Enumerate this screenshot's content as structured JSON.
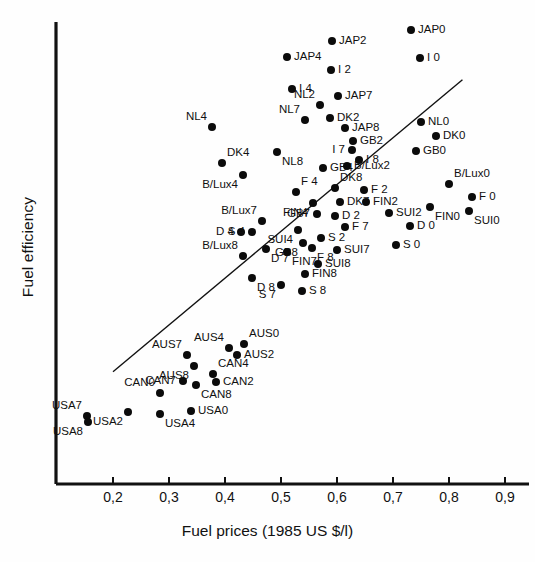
{
  "chart_data": {
    "type": "scatter",
    "title": "",
    "xlabel": "Fuel prices  (1985 US $/l)",
    "ylabel": "Fuel efficiency",
    "xlim": [
      0.15,
      0.93
    ],
    "ylim": [
      0,
      1
    ],
    "grid": false,
    "legend": "none",
    "xticks": [
      "0,2",
      "0,3",
      "0,4",
      "0,5",
      "0,6",
      "0,7",
      "0,8",
      "0,9"
    ],
    "xtick_values": [
      0.2,
      0.3,
      0.4,
      0.5,
      0.6,
      0.7,
      0.8,
      0.9
    ],
    "yticks": [],
    "annotations": [
      "Regression line drawn from lower-left to upper-right"
    ],
    "trend_line": {
      "x1": 0.2,
      "y1": 0.243,
      "x2": 0.824,
      "y2": 0.875
    },
    "points": [
      {
        "label": "JAP2",
        "px": 332,
        "py": 41,
        "side": "r"
      },
      {
        "label": "JAP0",
        "px": 411,
        "py": 30,
        "side": "r"
      },
      {
        "label": "JAP4",
        "px": 287,
        "py": 57,
        "side": "r"
      },
      {
        "label": "I 0",
        "px": 420,
        "py": 58,
        "side": "r"
      },
      {
        "label": "I 2",
        "px": 331,
        "py": 70,
        "side": "r"
      },
      {
        "label": "I 4",
        "px": 292,
        "py": 89,
        "side": "r"
      },
      {
        "label": "JAP7",
        "px": 338,
        "py": 96,
        "side": "r"
      },
      {
        "label": "NL2",
        "px": 320,
        "py": 105,
        "side": "lt"
      },
      {
        "label": "NL7",
        "px": 305,
        "py": 120,
        "side": "lt"
      },
      {
        "label": "DK2",
        "px": 330,
        "py": 118,
        "side": "r"
      },
      {
        "label": "NL4",
        "px": 212,
        "py": 127,
        "side": "lt"
      },
      {
        "label": "JAP8",
        "px": 345,
        "py": 128,
        "side": "r"
      },
      {
        "label": "NL0",
        "px": 421,
        "py": 122,
        "side": "r"
      },
      {
        "label": "DK0",
        "px": 436,
        "py": 136,
        "side": "r"
      },
      {
        "label": "GB2",
        "px": 353,
        "py": 141,
        "side": "r"
      },
      {
        "label": "I 7",
        "px": 352,
        "py": 150,
        "side": "l"
      },
      {
        "label": "GB0",
        "px": 416,
        "py": 151,
        "side": "r"
      },
      {
        "label": "I 8",
        "px": 359,
        "py": 160,
        "side": "r"
      },
      {
        "label": "NL8",
        "px": 277,
        "py": 152,
        "side": "rb"
      },
      {
        "label": "DK4",
        "px": 222,
        "py": 163,
        "side": "rt"
      },
      {
        "label": "GB4",
        "px": 323,
        "py": 168,
        "side": "r"
      },
      {
        "label": "B/Lux2",
        "px": 347,
        "py": 166,
        "side": "r"
      },
      {
        "label": "B/Lux4",
        "px": 243,
        "py": 175,
        "side": "lb"
      },
      {
        "label": "B/Lux0",
        "px": 449,
        "py": 184,
        "side": "rt"
      },
      {
        "label": "F 4",
        "px": 296,
        "py": 192,
        "side": "rt"
      },
      {
        "label": "DK8",
        "px": 335,
        "py": 188,
        "side": "rt"
      },
      {
        "label": "F 2",
        "px": 364,
        "py": 190,
        "side": "r"
      },
      {
        "label": "F 0",
        "px": 472,
        "py": 197,
        "side": "r"
      },
      {
        "label": "FIN4",
        "px": 313,
        "py": 203,
        "side": "lb"
      },
      {
        "label": "DK7",
        "px": 340,
        "py": 202,
        "side": "r"
      },
      {
        "label": "FIN2",
        "px": 366,
        "py": 202,
        "side": "r"
      },
      {
        "label": "FIN0",
        "px": 430,
        "py": 207,
        "side": "rb"
      },
      {
        "label": "SUI0",
        "px": 469,
        "py": 211,
        "side": "rb"
      },
      {
        "label": "SUI2",
        "px": 389,
        "py": 213,
        "side": "r"
      },
      {
        "label": "GB7",
        "px": 317,
        "py": 214,
        "side": "l"
      },
      {
        "label": "D 2",
        "px": 335,
        "py": 216,
        "side": "r"
      },
      {
        "label": "B/Lux7",
        "px": 262,
        "py": 221,
        "side": "lt"
      },
      {
        "label": "D 0",
        "px": 410,
        "py": 226,
        "side": "r"
      },
      {
        "label": "F 7",
        "px": 345,
        "py": 227,
        "side": "r"
      },
      {
        "label": "SUI4",
        "px": 298,
        "py": 230,
        "side": "lb"
      },
      {
        "label": "D 4",
        "px": 241,
        "py": 232,
        "side": "l"
      },
      {
        "label": "S 4",
        "px": 252,
        "py": 232,
        "side": "l"
      },
      {
        "label": "S 2",
        "px": 321,
        "py": 238,
        "side": "r"
      },
      {
        "label": "GB8",
        "px": 303,
        "py": 243,
        "side": "lb"
      },
      {
        "label": "S 0",
        "px": 396,
        "py": 245,
        "side": "r"
      },
      {
        "label": "D 7",
        "px": 266,
        "py": 249,
        "side": "rb"
      },
      {
        "label": "F 8",
        "px": 312,
        "py": 248,
        "side": "rb"
      },
      {
        "label": "SUI7",
        "px": 337,
        "py": 250,
        "side": "r"
      },
      {
        "label": "FIN7",
        "px": 287,
        "py": 252,
        "side": "rb"
      },
      {
        "label": "B/Lux8",
        "px": 243,
        "py": 256,
        "side": "lt"
      },
      {
        "label": "SUI8",
        "px": 318,
        "py": 264,
        "side": "r"
      },
      {
        "label": "FIN8",
        "px": 305,
        "py": 274,
        "side": "r"
      },
      {
        "label": "D 8",
        "px": 252,
        "py": 278,
        "side": "rb"
      },
      {
        "label": "S 7",
        "px": 281,
        "py": 285,
        "side": "lb"
      },
      {
        "label": "S 8",
        "px": 302,
        "py": 291,
        "side": "r"
      },
      {
        "label": "AUS0",
        "px": 244,
        "py": 344,
        "side": "rt"
      },
      {
        "label": "AUS4",
        "px": 229,
        "py": 348,
        "side": "lt"
      },
      {
        "label": "AUS7",
        "px": 187,
        "py": 355,
        "side": "lt"
      },
      {
        "label": "AUS2",
        "px": 237,
        "py": 355,
        "side": "r"
      },
      {
        "label": "AUS8",
        "px": 194,
        "py": 366,
        "side": "lb"
      },
      {
        "label": "CAN4",
        "px": 213,
        "py": 374,
        "side": "rt"
      },
      {
        "label": "CAN7",
        "px": 183,
        "py": 381,
        "side": "l"
      },
      {
        "label": "CAN2",
        "px": 216,
        "py": 382,
        "side": "r"
      },
      {
        "label": "CAN8",
        "px": 196,
        "py": 385,
        "side": "rb"
      },
      {
        "label": "CAN0",
        "px": 160,
        "py": 393,
        "side": "lt"
      },
      {
        "label": "USA7",
        "px": 87,
        "py": 416,
        "side": "lt"
      },
      {
        "label": "USA2",
        "px": 128,
        "py": 412,
        "side": "lb"
      },
      {
        "label": "USA4",
        "px": 160,
        "py": 414,
        "side": "rb"
      },
      {
        "label": "USA0",
        "px": 191,
        "py": 411,
        "side": "r"
      },
      {
        "label": "USA8",
        "px": 88,
        "py": 422,
        "side": "lb"
      }
    ]
  },
  "axes": {
    "x_axis_title": "Fuel prices  (1985 US $/l)",
    "y_axis_title": "Fuel efficiency"
  }
}
